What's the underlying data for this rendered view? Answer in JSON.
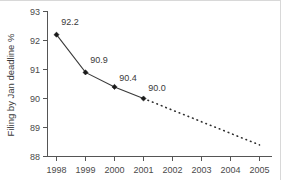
{
  "chart_data": {
    "type": "line",
    "title": "",
    "subtitle": "",
    "xlabel": "",
    "ylabel": "Filing by Jan deadline %",
    "x": [
      1998,
      1999,
      2000,
      2001,
      2002,
      2003,
      2004,
      2005
    ],
    "xtick_labels": [
      "1998",
      "1999",
      "2000",
      "2001",
      "2002",
      "2003",
      "2004",
      "2005"
    ],
    "xlim": [
      1997.6,
      2005.4
    ],
    "ytick_labels": [
      "88",
      "89",
      "90",
      "91",
      "92",
      "93"
    ],
    "ytick_values": [
      88,
      89,
      90,
      91,
      92,
      93
    ],
    "ylim": [
      88,
      93
    ],
    "grid": false,
    "legend": "none",
    "series": [
      {
        "name": "Actual filing by Jan deadline",
        "style": "solid",
        "marker": "filled-diamond",
        "x": [
          1998,
          1999,
          2000,
          2001
        ],
        "values": [
          92.2,
          90.9,
          90.4,
          90.0
        ],
        "data_labels": [
          "92.2",
          "90.9",
          "90.4",
          "90.0"
        ]
      },
      {
        "name": "Projected trend",
        "style": "dashed",
        "marker": "none",
        "x": [
          2001,
          2005
        ],
        "values": [
          90.0,
          88.4
        ],
        "data_labels": []
      }
    ],
    "colors": {
      "series_solid": "#3a3a3a",
      "series_dashed": "#2e2e2e",
      "marker": "#1a1a1a",
      "axis": "#555555",
      "text": "#3a3a3a",
      "background": "#ffffff"
    }
  },
  "labels": {
    "y_axis_title": "Filing by Jan deadline %",
    "y_tick_93": "93",
    "y_tick_92": "92",
    "y_tick_91": "91",
    "y_tick_90": "90",
    "y_tick_89": "89",
    "y_tick_88": "88",
    "x_tick_1998": "1998",
    "x_tick_1999": "1999",
    "x_tick_2000": "2000",
    "x_tick_2001": "2001",
    "x_tick_2002": "2002",
    "x_tick_2003": "2003",
    "x_tick_2004": "2004",
    "x_tick_2005": "2005",
    "point_label_1998": "92.2",
    "point_label_1999": "90.9",
    "point_label_2000": "90.4",
    "point_label_2001": "90.0"
  }
}
